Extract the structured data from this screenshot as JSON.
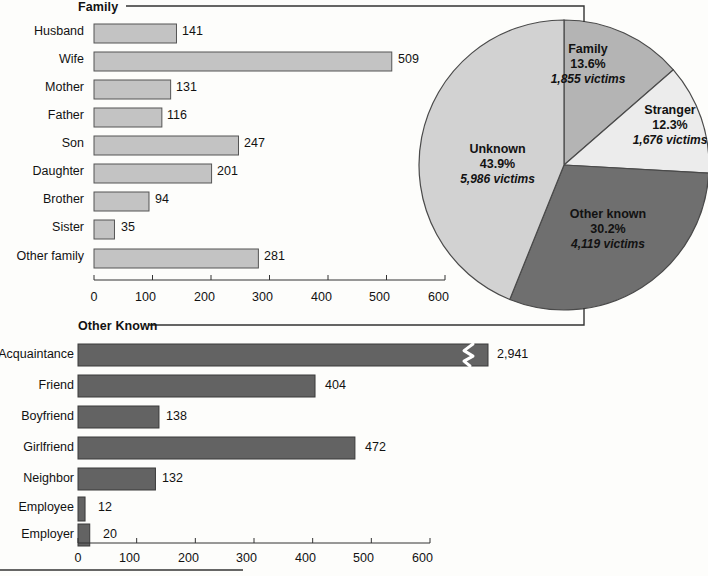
{
  "chart_data": [
    {
      "type": "bar",
      "title": "Family",
      "orientation": "horizontal",
      "xlabel": "",
      "ylabel": "",
      "xlim": [
        0,
        600
      ],
      "ticks": [
        0,
        100,
        200,
        300,
        400,
        500,
        600
      ],
      "grid": false,
      "bar_color": "#c3c3c3",
      "categories": [
        "Husband",
        "Wife",
        "Mother",
        "Father",
        "Son",
        "Daughter",
        "Brother",
        "Sister",
        "Other family"
      ],
      "values": [
        141,
        509,
        131,
        116,
        247,
        201,
        94,
        35,
        281
      ],
      "value_labels": [
        "141",
        "509",
        "131",
        "116",
        "247",
        "201",
        "94",
        "35",
        "281"
      ]
    },
    {
      "type": "pie",
      "title": "",
      "legend_position": "inside-slices",
      "slices": [
        {
          "name": "Family",
          "percent": 13.6,
          "percent_label": "13.6%",
          "victims": 1855,
          "victims_label": "1,855 victims",
          "color": "#b4b4b4"
        },
        {
          "name": "Stranger",
          "percent": 12.3,
          "percent_label": "12.3%",
          "victims": 1676,
          "victims_label": "1,676 victims",
          "color": "#ececec"
        },
        {
          "name": "Other known",
          "percent": 30.2,
          "percent_label": "30.2%",
          "victims": 4119,
          "victims_label": "4,119 victims",
          "color": "#6f6f6f"
        },
        {
          "name": "Unknown",
          "percent": 43.9,
          "percent_label": "43.9%",
          "victims": 5986,
          "victims_label": "5,986 victims",
          "color": "#d2d2d2"
        }
      ]
    },
    {
      "type": "bar",
      "title": "Other Known",
      "orientation": "horizontal",
      "xlabel": "",
      "ylabel": "",
      "xlim": [
        0,
        600
      ],
      "ticks": [
        0,
        100,
        200,
        300,
        400,
        500,
        600
      ],
      "grid": false,
      "bar_color": "#636363",
      "axis_break": {
        "category": "Acquaintance",
        "note": "zigzag break mark in bar"
      },
      "categories": [
        "Acquaintance",
        "Friend",
        "Boyfriend",
        "Girlfriend",
        "Neighbor",
        "Employee",
        "Employer"
      ],
      "values": [
        2941,
        404,
        138,
        472,
        132,
        12,
        20
      ],
      "value_labels": [
        "2,941",
        "404",
        "138",
        "472",
        "132",
        "12",
        "20"
      ]
    }
  ],
  "family_panel": {
    "title": "Family",
    "axis_ticks": [
      "0",
      "100",
      "200",
      "300",
      "400",
      "500",
      "600"
    ],
    "rows": [
      {
        "label": "Husband",
        "value": "141"
      },
      {
        "label": "Wife",
        "value": "509"
      },
      {
        "label": "Mother",
        "value": "131"
      },
      {
        "label": "Father",
        "value": "116"
      },
      {
        "label": "Son",
        "value": "247"
      },
      {
        "label": "Daughter",
        "value": "201"
      },
      {
        "label": "Brother",
        "value": "94"
      },
      {
        "label": "Sister",
        "value": "35"
      },
      {
        "label": "Other family",
        "value": "281"
      }
    ]
  },
  "other_known_panel": {
    "title": "Other Known",
    "axis_ticks": [
      "0",
      "100",
      "200",
      "300",
      "400",
      "500",
      "600"
    ],
    "rows": [
      {
        "label": "Acquaintance",
        "value": "2,941"
      },
      {
        "label": "Friend",
        "value": "404"
      },
      {
        "label": "Boyfriend",
        "value": "138"
      },
      {
        "label": "Girlfriend",
        "value": "472"
      },
      {
        "label": "Neighbor",
        "value": "132"
      },
      {
        "label": "Employee",
        "value": "12"
      },
      {
        "label": "Employer",
        "value": "20"
      }
    ]
  },
  "pie_panel": {
    "slices": [
      {
        "name": "Family",
        "percent_label": "13.6%",
        "victims_label": "1,855 victims"
      },
      {
        "name": "Stranger",
        "percent_label": "12.3%",
        "victims_label": "1,676 victims"
      },
      {
        "name": "Other known",
        "percent_label": "30.2%",
        "victims_label": "4,119 victims"
      },
      {
        "name": "Unknown",
        "percent_label": "43.9%",
        "victims_label": "5,986 victims"
      }
    ]
  }
}
